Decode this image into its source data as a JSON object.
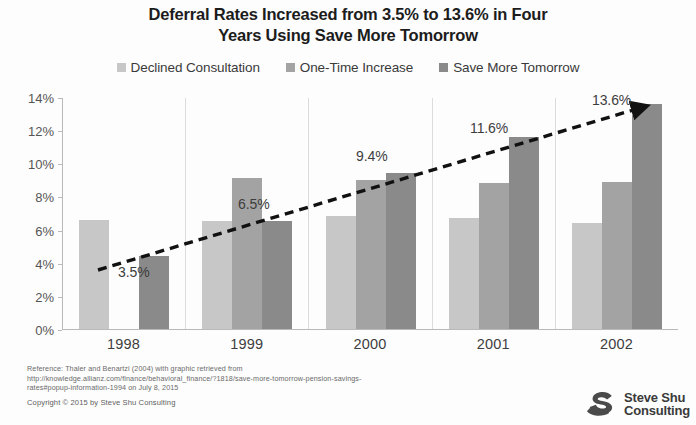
{
  "chart_data": {
    "type": "bar",
    "title": "Deferral Rates Increased from 3.5% to 13.6% in Four Years Using Save More Tomorrow",
    "title_line1": "Deferral Rates Increased from 3.5% to 13.6% in Four",
    "title_line2": "Years Using Save More Tomorrow",
    "xlabel": "",
    "ylabel": "",
    "categories": [
      "1998",
      "1999",
      "2000",
      "2001",
      "2002"
    ],
    "ytick_labels": [
      "0%",
      "2%",
      "4%",
      "6%",
      "8%",
      "10%",
      "12%",
      "14%"
    ],
    "ytick_values": [
      0,
      2,
      4,
      6,
      8,
      10,
      12,
      14
    ],
    "ylim": [
      0,
      14
    ],
    "grid": false,
    "legend_position": "top-center",
    "series": [
      {
        "name": "Declined Consultation",
        "color": "#c7c7c7",
        "values": [
          6.6,
          6.5,
          6.8,
          6.7,
          6.4
        ]
      },
      {
        "name": "One-Time Increase",
        "color": "#a3a3a3",
        "values": [
          null,
          9.1,
          9.0,
          8.8,
          8.9
        ]
      },
      {
        "name": "Save More Tomorrow",
        "color": "#8a8a8a",
        "values": [
          4.4,
          6.5,
          9.4,
          11.6,
          13.6
        ]
      }
    ],
    "annotations": [
      {
        "label": "3.5%",
        "value": 3.5,
        "category": "1998"
      },
      {
        "label": "6.5%",
        "value": 6.5,
        "category": "1999"
      },
      {
        "label": "9.4%",
        "value": 9.4,
        "category": "2000"
      },
      {
        "label": "11.6%",
        "value": 11.6,
        "category": "2001"
      },
      {
        "label": "13.6%",
        "value": 13.6,
        "category": "2002"
      }
    ],
    "trend_line": {
      "style": "dashed",
      "color": "#111111",
      "arrow_end": true,
      "points": [
        {
          "x": "1998",
          "y": 3.5
        },
        {
          "x": "2002",
          "y": 13.6
        }
      ]
    }
  },
  "legend": {
    "items": [
      {
        "label": "Declined Consultation",
        "color": "#c7c7c7"
      },
      {
        "label": "One-Time Increase",
        "color": "#a3a3a3"
      },
      {
        "label": "Save More Tomorrow",
        "color": "#8a8a8a"
      }
    ]
  },
  "footnote": {
    "line1": "Reference: Thaler and Benartzi (2004) with graphic retrieved from",
    "line2": "http://knowledge.allianz.com/finance/behavioral_finance/?1818/save-more-tomorrow-pension-savings-",
    "line3": "rates#popup-information-1994 on July 8, 2015",
    "copyright": "Copyright © 2015 by Steve Shu Consulting"
  },
  "logo": {
    "line1": "Steve Shu",
    "line2": "Consulting",
    "mark_color": "#4a4a4a"
  }
}
